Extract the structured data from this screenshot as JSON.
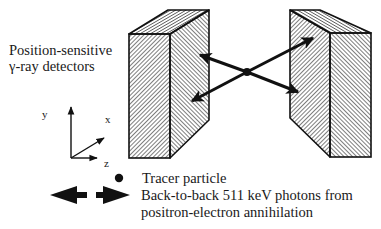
{
  "title_label": {
    "line1": "Position-sensitive",
    "line2": "γ-ray detectors"
  },
  "axes": {
    "y": "y",
    "x": "x",
    "z": "z"
  },
  "legend": {
    "tracer": "Tracer particle",
    "photons_line1": "Back-to-back 511 keV photons from",
    "photons_line2": "positron-electron annihilation"
  },
  "colors": {
    "ink": "#111111",
    "background": "#ffffff"
  }
}
